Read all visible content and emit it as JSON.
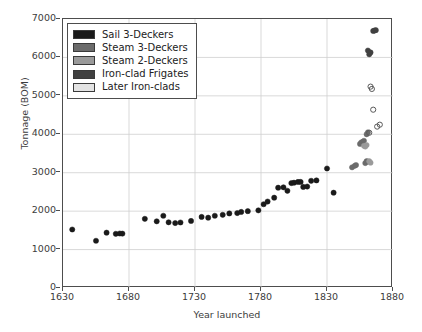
{
  "chart_data": {
    "type": "scatter",
    "title": "",
    "xlabel": "Year launched",
    "ylabel": "Tonnage (BOM)",
    "xlim": [
      1630,
      1880
    ],
    "ylim": [
      0,
      7000
    ],
    "xticks": [
      1630,
      1680,
      1730,
      1780,
      1830,
      1880
    ],
    "yticks": [
      0,
      1000,
      2000,
      3000,
      4000,
      5000,
      6000,
      7000
    ],
    "grid": true,
    "legend_position": "upper left",
    "series": [
      {
        "name": "Sail 3-Deckers",
        "color": "#1a1a1a",
        "marker": "filled-circle",
        "points": [
          [
            1637,
            1522
          ],
          [
            1655,
            1229
          ],
          [
            1663,
            1440
          ],
          [
            1670,
            1410
          ],
          [
            1673,
            1418
          ],
          [
            1675,
            1415
          ],
          [
            1692,
            1800
          ],
          [
            1701,
            1735
          ],
          [
            1706,
            1880
          ],
          [
            1710,
            1710
          ],
          [
            1715,
            1690
          ],
          [
            1719,
            1705
          ],
          [
            1727,
            1745
          ],
          [
            1735,
            1850
          ],
          [
            1740,
            1830
          ],
          [
            1745,
            1880
          ],
          [
            1751,
            1905
          ],
          [
            1756,
            1940
          ],
          [
            1762,
            1950
          ],
          [
            1765,
            1980
          ],
          [
            1770,
            2000
          ],
          [
            1778,
            2020
          ],
          [
            1782,
            2180
          ],
          [
            1785,
            2250
          ],
          [
            1790,
            2350
          ],
          [
            1793,
            2610
          ],
          [
            1797,
            2620
          ],
          [
            1800,
            2530
          ],
          [
            1803,
            2730
          ],
          [
            1805,
            2740
          ],
          [
            1808,
            2760
          ],
          [
            1810,
            2760
          ],
          [
            1812,
            2630
          ],
          [
            1815,
            2640
          ],
          [
            1818,
            2790
          ],
          [
            1822,
            2800
          ],
          [
            1830,
            3110
          ],
          [
            1835,
            2480
          ]
        ]
      },
      {
        "name": "Steam 3-Deckers",
        "color": "#6b6b6b",
        "marker": "filled-circle",
        "points": [
          [
            1849,
            3140
          ],
          [
            1851,
            3180
          ],
          [
            1852,
            3200
          ],
          [
            1855,
            3750
          ],
          [
            1856,
            3790
          ],
          [
            1857,
            3800
          ],
          [
            1858,
            3830
          ],
          [
            1860,
            4000
          ],
          [
            1861,
            4050
          ],
          [
            1859,
            3250
          ],
          [
            1860,
            3300
          ],
          [
            1861,
            3290
          ]
        ]
      },
      {
        "name": "Steam 2-Deckers",
        "color": "#9a9a9a",
        "marker": "filled-circle",
        "points": [
          [
            1858,
            3700
          ],
          [
            1859,
            3680
          ],
          [
            1860,
            3720
          ],
          [
            1862,
            3300
          ],
          [
            1863,
            3260
          ]
        ]
      },
      {
        "name": "Iron-clad Frigates",
        "color": "#404040",
        "marker": "filled-circle",
        "points": [
          [
            1861,
            6180
          ],
          [
            1862,
            6080
          ],
          [
            1863,
            6130
          ],
          [
            1865,
            6690
          ],
          [
            1866,
            6700
          ],
          [
            1867,
            6710
          ]
        ]
      },
      {
        "name": "Later Iron-clads",
        "color": "#d9d9d9",
        "marker": "open-circle",
        "points": [
          [
            1863,
            5240
          ],
          [
            1864,
            5180
          ],
          [
            1865,
            4640
          ],
          [
            1868,
            4200
          ],
          [
            1870,
            4250
          ],
          [
            1862,
            4040
          ]
        ]
      }
    ]
  },
  "legend": {
    "entries": [
      {
        "label": "Sail 3-Deckers",
        "color": "#1a1a1a"
      },
      {
        "label": "Steam 3-Deckers",
        "color": "#6b6b6b"
      },
      {
        "label": "Steam 2-Deckers",
        "color": "#9a9a9a"
      },
      {
        "label": "Iron-clad Frigates",
        "color": "#404040"
      },
      {
        "label": "Later Iron-clads",
        "color": "#e3e3e3"
      }
    ]
  }
}
